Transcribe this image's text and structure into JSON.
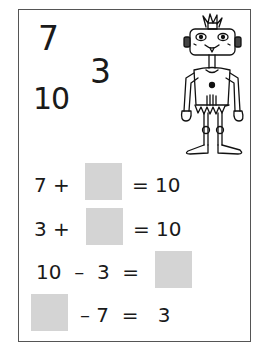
{
  "numbers": {
    "top": "7",
    "middle": "3",
    "bottom": "10"
  },
  "equations": [
    {
      "left": "7 +",
      "right": "= 10"
    },
    {
      "left": "3 +",
      "right": "= 10"
    },
    {
      "left": "10  –  3  =",
      "right": ""
    },
    {
      "left": "",
      "right": "– 7  =   3"
    }
  ],
  "colors": {
    "answer_box": "#d4d4d4",
    "border": "#555555"
  },
  "illustration": "robot-drawing"
}
